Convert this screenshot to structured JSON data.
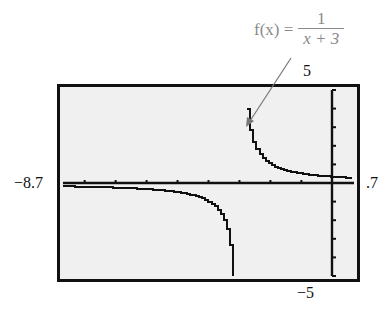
{
  "annotation": {
    "lhs": "f(x) =",
    "numerator": "1",
    "denominator": "x + 3",
    "color": "#8a8a8a"
  },
  "window": {
    "xmin_label": "−8.7",
    "xmax_label": ".7",
    "ymax_label": "5",
    "ymin_label": "−5"
  },
  "colors": {
    "screen_bg": "#f0f0f0",
    "frame": "#111111",
    "curve": "#111111",
    "arrow": "#777777"
  },
  "chart_data": {
    "type": "line",
    "function": "1/(x+3)",
    "xlabel": "",
    "ylabel": "",
    "xlim": [
      -8.7,
      0.7
    ],
    "ylim": [
      -5,
      5
    ],
    "xscale": 1,
    "yscale": 1,
    "grid": false,
    "vertical_asymptote": -3,
    "horizontal_asymptote": 0,
    "series": [
      {
        "name": "left branch",
        "x": [
          -8.7,
          -8,
          -7,
          -6,
          -5,
          -4.5,
          -4,
          -3.75,
          -3.5,
          -3.33,
          -3.2
        ],
        "y": [
          -0.175,
          -0.2,
          -0.25,
          -0.333,
          -0.5,
          -0.667,
          -1,
          -1.333,
          -2,
          -3.03,
          -5
        ]
      },
      {
        "name": "right branch",
        "x": [
          -2.8,
          -2.67,
          -2.5,
          -2.25,
          -2,
          -1.5,
          -1,
          0,
          0.7
        ],
        "y": [
          5,
          3.03,
          2,
          1.333,
          1,
          0.667,
          0.5,
          0.333,
          0.27
        ]
      }
    ]
  }
}
